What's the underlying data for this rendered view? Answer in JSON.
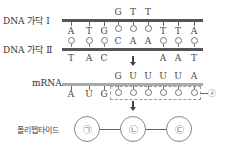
{
  "labels": {
    "strand1": "DNA 가닥 Ⅰ",
    "strand2": "DNA 가닥 Ⅱ",
    "mrna": "mRNA",
    "polypeptide": "폴리펩타이드",
    "marker_a": "ⓐ"
  },
  "strand1": {
    "below": [
      "A",
      "T",
      "G",
      "",
      "",
      "",
      "T",
      "T",
      "A"
    ],
    "above": [
      "",
      "",
      "",
      "G",
      "T",
      "T",
      "",
      "",
      ""
    ]
  },
  "strand2": {
    "above": [
      "",
      "",
      "",
      "C",
      "A",
      "A",
      "",
      "",
      ""
    ],
    "below": [
      "T",
      "A",
      "C",
      "",
      "",
      "",
      "A",
      "A",
      "T"
    ]
  },
  "mrna": {
    "above": [
      "",
      "",
      "",
      "G",
      "U",
      "U",
      "U",
      "U",
      "A"
    ],
    "below": [
      "A",
      "U",
      "G",
      "",
      "",
      "",
      "",
      "",
      ""
    ]
  },
  "polypeptide": {
    "amino_acids": [
      "㉠",
      "㉡",
      "㉢"
    ]
  }
}
